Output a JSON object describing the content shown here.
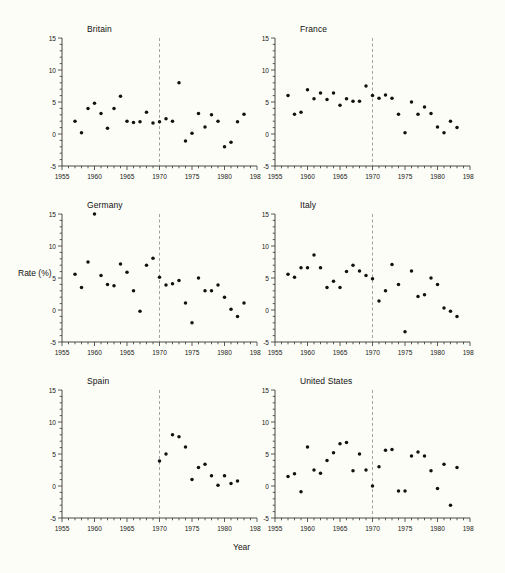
{
  "figure": {
    "xlabel": "Year",
    "ylabel": "Rate (%)",
    "background": "#fdfdf7",
    "marker_color": "#111111",
    "axis_color": "#333333",
    "reference_line_color": "#999999"
  },
  "chart_data": [
    {
      "type": "scatter",
      "title": "Britain",
      "xlabel": "Year",
      "ylabel": "Rate (%)",
      "xlim": [
        1955,
        1985
      ],
      "ylim": [
        -5,
        15
      ],
      "xticks": [
        1955,
        1960,
        1965,
        1970,
        1975,
        1980,
        1985
      ],
      "yticks": [
        -5,
        0,
        5,
        10,
        15
      ],
      "xminor_step": 1,
      "yminor_step": 1,
      "grid": false,
      "legend": "none",
      "annotations": [
        {
          "type": "vline",
          "x": 1970,
          "style": "dashed"
        }
      ],
      "x": [
        1957,
        1958,
        1959,
        1960,
        1961,
        1962,
        1963,
        1964,
        1965,
        1966,
        1967,
        1968,
        1969,
        1970,
        1971,
        1972,
        1973,
        1974,
        1975,
        1976,
        1977,
        1978,
        1979,
        1980,
        1981,
        1982,
        1983
      ],
      "y": [
        2.0,
        0.2,
        4.0,
        4.8,
        3.2,
        0.9,
        4.0,
        5.9,
        2.0,
        1.8,
        1.9,
        3.4,
        1.7,
        1.9,
        2.4,
        2.0,
        8.0,
        -1.1,
        0.1,
        3.2,
        1.1,
        3.0,
        2.0,
        -2.0,
        -1.3,
        1.9,
        3.1
      ]
    },
    {
      "type": "scatter",
      "title": "France",
      "xlabel": "Year",
      "ylabel": "Rate (%)",
      "xlim": [
        1955,
        1985
      ],
      "ylim": [
        -5,
        15
      ],
      "xticks": [
        1955,
        1960,
        1965,
        1970,
        1975,
        1980,
        1985
      ],
      "yticks": [
        -5,
        0,
        5,
        10,
        15
      ],
      "xminor_step": 1,
      "yminor_step": 1,
      "grid": false,
      "legend": "none",
      "annotations": [
        {
          "type": "vline",
          "x": 1970,
          "style": "dashed"
        }
      ],
      "x": [
        1957,
        1958,
        1959,
        1960,
        1961,
        1962,
        1963,
        1964,
        1965,
        1966,
        1967,
        1968,
        1969,
        1970,
        1971,
        1972,
        1973,
        1974,
        1975,
        1976,
        1977,
        1978,
        1979,
        1980,
        1981,
        1982,
        1983
      ],
      "y": [
        6.0,
        3.1,
        3.4,
        6.9,
        5.5,
        6.4,
        5.4,
        6.4,
        4.5,
        5.5,
        5.1,
        5.1,
        7.5,
        6.0,
        5.6,
        6.1,
        5.6,
        3.1,
        0.2,
        5.0,
        3.1,
        4.2,
        3.2,
        1.1,
        0.2,
        2.0,
        1.0
      ]
    },
    {
      "type": "scatter",
      "title": "Germany",
      "xlabel": "Year",
      "ylabel": "Rate (%)",
      "xlim": [
        1955,
        1985
      ],
      "ylim": [
        -5,
        15
      ],
      "xticks": [
        1955,
        1960,
        1965,
        1970,
        1975,
        1980,
        1985
      ],
      "yticks": [
        -5,
        0,
        5,
        10,
        15
      ],
      "xminor_step": 1,
      "yminor_step": 1,
      "grid": false,
      "legend": "none",
      "annotations": [
        {
          "type": "vline",
          "x": 1970,
          "style": "dashed"
        }
      ],
      "x": [
        1957,
        1958,
        1959,
        1960,
        1961,
        1962,
        1963,
        1964,
        1965,
        1966,
        1967,
        1968,
        1969,
        1970,
        1971,
        1972,
        1973,
        1974,
        1975,
        1976,
        1977,
        1978,
        1979,
        1980,
        1981,
        1982,
        1983
      ],
      "y": [
        5.6,
        3.5,
        7.5,
        15.0,
        5.4,
        4.0,
        3.8,
        7.2,
        5.9,
        3.0,
        -0.2,
        7.0,
        8.1,
        5.1,
        3.9,
        4.1,
        4.6,
        1.1,
        -2.0,
        5.0,
        3.0,
        3.0,
        3.9,
        2.0,
        0.1,
        -1.0,
        1.1
      ]
    },
    {
      "type": "scatter",
      "title": "Italy",
      "xlabel": "Year",
      "ylabel": "Rate (%)",
      "xlim": [
        1955,
        1985
      ],
      "ylim": [
        -5,
        15
      ],
      "xticks": [
        1955,
        1960,
        1965,
        1970,
        1975,
        1980,
        1985
      ],
      "yticks": [
        -5,
        0,
        5,
        10,
        15
      ],
      "xminor_step": 1,
      "yminor_step": 1,
      "grid": false,
      "legend": "none",
      "annotations": [
        {
          "type": "vline",
          "x": 1970,
          "style": "dashed"
        }
      ],
      "x": [
        1957,
        1958,
        1959,
        1960,
        1961,
        1962,
        1963,
        1964,
        1965,
        1966,
        1967,
        1968,
        1969,
        1970,
        1971,
        1972,
        1973,
        1974,
        1975,
        1976,
        1977,
        1978,
        1979,
        1980,
        1981,
        1982,
        1983
      ],
      "y": [
        5.6,
        5.1,
        6.6,
        6.6,
        8.6,
        6.6,
        3.5,
        4.5,
        3.5,
        6.0,
        7.0,
        6.1,
        5.4,
        4.9,
        1.4,
        3.0,
        7.1,
        4.0,
        -3.4,
        6.1,
        2.1,
        2.4,
        5.0,
        4.0,
        0.3,
        -0.2,
        -1.0
      ]
    },
    {
      "type": "scatter",
      "title": "Spain",
      "xlabel": "Year",
      "ylabel": "Rate (%)",
      "xlim": [
        1955,
        1985
      ],
      "ylim": [
        -5,
        15
      ],
      "xticks": [
        1955,
        1960,
        1965,
        1970,
        1975,
        1980,
        1985
      ],
      "yticks": [
        -5,
        0,
        5,
        10,
        15
      ],
      "xminor_step": 1,
      "yminor_step": 1,
      "grid": false,
      "legend": "none",
      "annotations": [
        {
          "type": "vline",
          "x": 1970,
          "style": "dashed"
        }
      ],
      "x": [
        1970,
        1971,
        1972,
        1973,
        1974,
        1975,
        1976,
        1977,
        1978,
        1979,
        1980,
        1981,
        1982
      ],
      "y": [
        3.9,
        5.0,
        8.0,
        7.7,
        6.1,
        1.0,
        2.9,
        3.4,
        1.6,
        0.1,
        1.6,
        0.4,
        0.8
      ]
    },
    {
      "type": "scatter",
      "title": "United States",
      "xlabel": "Year",
      "ylabel": "Rate (%)",
      "xlim": [
        1955,
        1985
      ],
      "ylim": [
        -5,
        15
      ],
      "xticks": [
        1955,
        1960,
        1965,
        1970,
        1975,
        1980,
        1985
      ],
      "yticks": [
        -5,
        0,
        5,
        10,
        15
      ],
      "xminor_step": 1,
      "yminor_step": 1,
      "grid": false,
      "legend": "none",
      "annotations": [
        {
          "type": "vline",
          "x": 1970,
          "style": "dashed"
        }
      ],
      "x": [
        1957,
        1958,
        1959,
        1960,
        1961,
        1962,
        1963,
        1964,
        1965,
        1966,
        1967,
        1968,
        1969,
        1970,
        1971,
        1972,
        1973,
        1974,
        1975,
        1976,
        1977,
        1978,
        1979,
        1980,
        1981,
        1982,
        1983
      ],
      "y": [
        1.5,
        1.9,
        -0.9,
        6.1,
        2.5,
        2.0,
        4.0,
        5.2,
        6.6,
        6.8,
        2.4,
        5.0,
        2.5,
        0.0,
        3.0,
        5.6,
        5.7,
        -0.8,
        -0.8,
        4.7,
        5.3,
        4.7,
        2.4,
        -0.4,
        3.4,
        -3.0,
        2.9
      ]
    }
  ],
  "panels": [
    {
      "name": "britain",
      "title_left": 87,
      "title_top": 24,
      "plot_left": 62,
      "plot_top": 38
    },
    {
      "name": "france",
      "title_left": 300,
      "title_top": 24,
      "plot_left": 275,
      "plot_top": 38
    },
    {
      "name": "germany",
      "title_left": 87,
      "title_top": 200,
      "plot_left": 62,
      "plot_top": 214
    },
    {
      "name": "italy",
      "title_left": 300,
      "title_top": 200,
      "plot_left": 275,
      "plot_top": 214
    },
    {
      "name": "spain",
      "title_left": 87,
      "title_top": 376,
      "plot_left": 62,
      "plot_top": 390
    },
    {
      "name": "united-states",
      "title_left": 300,
      "title_top": 376,
      "plot_left": 275,
      "plot_top": 390
    }
  ]
}
